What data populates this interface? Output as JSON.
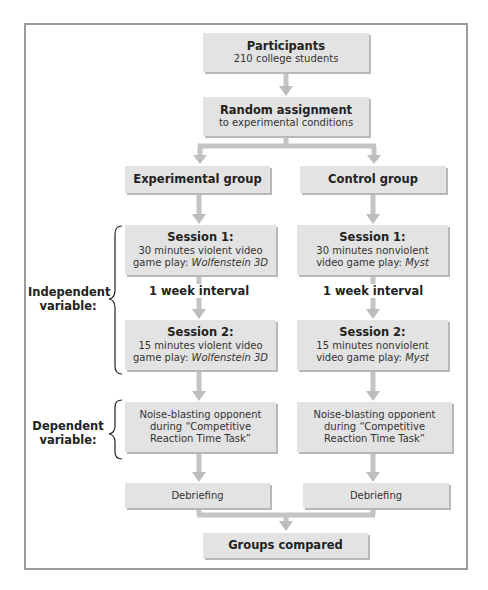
{
  "participants": {
    "title": "Participants",
    "subtitle": "210 college students"
  },
  "random_assignment": {
    "title": "Random assignment",
    "subtitle": "to experimental conditions"
  },
  "groups": {
    "experimental": {
      "label": "Experimental group",
      "session1": {
        "title": "Session 1:",
        "line1": "30 minutes violent video",
        "line2_prefix": "game play: ",
        "game": "Wolfenstein 3D"
      },
      "interval": "1 week interval",
      "session2": {
        "title": "Session 2:",
        "line1": "15 minutes violent video",
        "line2_prefix": "game play: ",
        "game": "Wolfenstein 3D"
      },
      "measure": {
        "line1": "Noise-blasting opponent",
        "line2": "during “Competitive",
        "line3": "Reaction Time Task”"
      },
      "debriefing": "Debriefing"
    },
    "control": {
      "label": "Control group",
      "session1": {
        "title": "Session 1:",
        "line1": "30 minutes nonviolent",
        "line2_prefix": "video game play: ",
        "game": "Myst"
      },
      "interval": "1 week interval",
      "session2": {
        "title": "Session 2:",
        "line1": "15 minutes nonviolent",
        "line2_prefix": "video game play: ",
        "game": "Myst"
      },
      "measure": {
        "line1": "Noise-blasting opponent",
        "line2": "during “Competitive",
        "line3": "Reaction Time Task”"
      },
      "debriefing": "Debriefing"
    }
  },
  "labels": {
    "independent_line1": "Independent",
    "independent_line2": "variable:",
    "dependent_line1": "Dependent",
    "dependent_line2": "variable:"
  },
  "final": {
    "title": "Groups compared"
  },
  "colors": {
    "box_fill": "#e3e3e3",
    "box_shadow": "#b8b8b8",
    "arrow": "#bdbdbd",
    "frame": "#9b9b9b",
    "text": "#222222"
  }
}
